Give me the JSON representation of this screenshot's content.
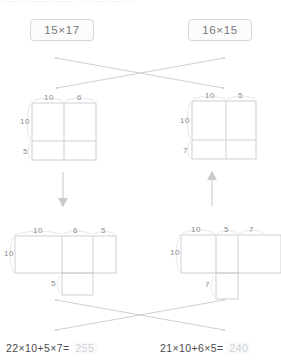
{
  "header": {
    "clipped_text": "—— ——— ——   —  —— — —"
  },
  "problems": {
    "left": {
      "chip_label": "15×17",
      "grid": {
        "top_labels": [
          "10",
          "6"
        ],
        "left_labels": [
          "10",
          "5"
        ]
      },
      "decomposed": {
        "top_labels": [
          "10",
          "6",
          "5"
        ],
        "left_label": "10",
        "bottom_label": "5"
      },
      "equation_text": "22×10+5×7=",
      "equation_answer": "255"
    },
    "right": {
      "chip_label": "16×15",
      "grid": {
        "top_labels": [
          "10",
          "5"
        ],
        "left_labels": [
          "10",
          "7"
        ]
      },
      "decomposed": {
        "top_labels": [
          "10",
          "5",
          "7"
        ],
        "left_label": "10",
        "bottom_label": "7"
      },
      "equation_text": "21×10+6×5=",
      "equation_answer": "240"
    }
  },
  "colors": {
    "line": "#c9c9ce",
    "label": "#8a8a90",
    "chip_border": "#d9d9dd",
    "answer": "#d2d2d6",
    "equation": "#4a4a4e"
  }
}
